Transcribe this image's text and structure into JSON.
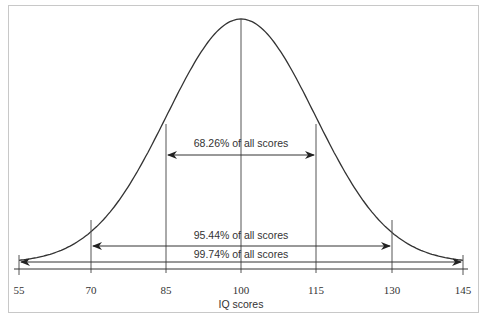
{
  "chart_data": {
    "type": "line",
    "title": "",
    "xlabel": "IQ scores",
    "ylabel": "",
    "x_ticks": [
      55,
      70,
      85,
      100,
      115,
      130,
      145
    ],
    "xlim": [
      55,
      145
    ],
    "grid": false,
    "distribution": {
      "name": "normal",
      "mean": 100,
      "sd": 15
    },
    "annotations": [
      {
        "text": "68.26% of all scores",
        "range": [
          85,
          115
        ]
      },
      {
        "text": "95.44% of all scores",
        "range": [
          70,
          130
        ]
      },
      {
        "text": "99.74% of all scores",
        "range": [
          55,
          145
        ]
      }
    ],
    "vertical_lines": [
      55,
      70,
      85,
      100,
      115,
      130,
      145
    ]
  },
  "labels": {
    "xlabel": "IQ scores",
    "t0": "55",
    "t1": "70",
    "t2": "85",
    "t3": "100",
    "t4": "115",
    "t5": "130",
    "t6": "145",
    "a1": "68.26% of all scores",
    "a2": "95.44% of all scores",
    "a3": "99.74% of all scores"
  }
}
